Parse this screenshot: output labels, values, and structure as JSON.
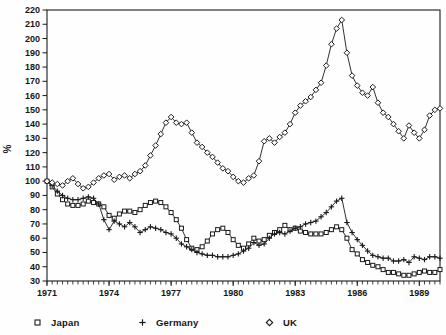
{
  "page": {
    "background": "#fefefe",
    "ink": "#1a1a1a",
    "label_color": "#161616"
  },
  "chart_data": {
    "type": "line",
    "title": "",
    "xlabel": "",
    "ylabel": "%",
    "ylim": [
      30,
      220
    ],
    "y_tick_step": 10,
    "x_start": 1971,
    "x_end": 1990,
    "x_step": 0.25,
    "x_tick_years": [
      1971,
      1974,
      1977,
      1980,
      1983,
      1986,
      1989
    ],
    "grid": false,
    "legend_position": "bottom",
    "series": [
      {
        "name": "Japan",
        "marker": "square",
        "values": [
          100,
          96,
          91,
          87,
          84,
          83,
          83,
          84,
          86,
          85,
          84,
          82,
          76,
          74,
          77,
          79,
          79,
          78,
          80,
          83,
          85,
          86,
          85,
          82,
          78,
          73,
          67,
          59,
          53,
          52,
          54,
          58,
          63,
          66,
          67,
          64,
          59,
          55,
          53,
          56,
          60,
          58,
          59,
          62,
          64,
          66,
          69,
          66,
          67,
          65,
          64,
          63,
          63,
          63,
          64,
          66,
          68,
          66,
          60,
          52,
          49,
          45,
          43,
          41,
          40,
          38,
          36,
          36,
          35,
          34,
          34,
          35,
          36,
          37,
          36,
          36,
          38
        ]
      },
      {
        "name": "Germany",
        "marker": "plus",
        "values": [
          100,
          97,
          93,
          90,
          88,
          87,
          87,
          88,
          89,
          88,
          84,
          73,
          66,
          72,
          70,
          68,
          71,
          68,
          64,
          66,
          68,
          67,
          66,
          64,
          63,
          60,
          56,
          54,
          52,
          50,
          49,
          48,
          48,
          47,
          47,
          47,
          48,
          49,
          51,
          53,
          57,
          55,
          56,
          60,
          63,
          64,
          63,
          65,
          67,
          68,
          70,
          71,
          72,
          75,
          78,
          82,
          86,
          88,
          71,
          64,
          59,
          55,
          51,
          48,
          47,
          46,
          46,
          44,
          44,
          45,
          43,
          47,
          46,
          45,
          47,
          47,
          46
        ]
      },
      {
        "name": "UK",
        "marker": "diamond",
        "values": [
          100,
          99,
          98,
          97,
          100,
          102,
          98,
          95,
          96,
          99,
          102,
          104,
          105,
          101,
          103,
          104,
          102,
          105,
          107,
          111,
          118,
          125,
          133,
          141,
          145,
          141,
          140,
          141,
          134,
          127,
          124,
          120,
          117,
          113,
          109,
          107,
          103,
          100,
          99,
          102,
          104,
          114,
          128,
          130,
          127,
          131,
          134,
          140,
          148,
          153,
          156,
          159,
          164,
          169,
          181,
          196,
          207,
          213,
          190,
          174,
          167,
          162,
          160,
          166,
          155,
          148,
          145,
          140,
          135,
          130,
          139,
          134,
          130,
          136,
          146,
          150,
          151
        ]
      }
    ]
  }
}
